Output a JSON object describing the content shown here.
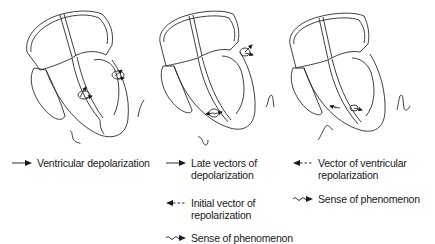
{
  "diagram": {
    "panels": [
      {
        "id": "panel-1",
        "title": "Ventricular depolarization",
        "waves": [
          "upper-right small deflection",
          "lower-left small deflection"
        ]
      },
      {
        "id": "panel-2",
        "title": "Late vectors of depolarization / initial repolarization",
        "waves": [
          "bottom negative deflection",
          "right positive deflection"
        ]
      },
      {
        "id": "panel-3",
        "title": "Vector of ventricular repolarization",
        "waves": [
          "lower-left complex",
          "right positive T complex"
        ]
      }
    ],
    "colors": {
      "stroke": "#2a2a2a",
      "background": "#ffffff"
    }
  },
  "legend": {
    "ventricular_depolarization": "Ventricular depolarization",
    "late_vectors": "Late vectors of\ndepolarization",
    "initial_vector": "Initial vector of\nrepolarization",
    "sense_1": "Sense of phenomenon",
    "vector_ventricular_repol": "Vector of ventricular\nrepolarization",
    "sense_2": "Sense of phenomenon"
  }
}
